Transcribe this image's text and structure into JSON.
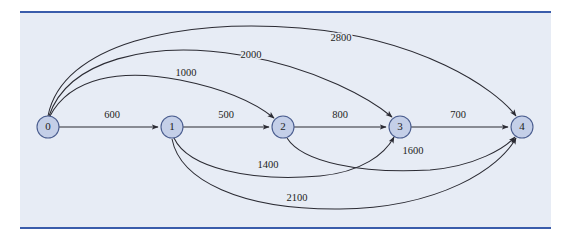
{
  "figure": {
    "type": "directed-weighted-graph",
    "title": "",
    "panel": {
      "x": 20,
      "y": 11,
      "width": 531,
      "height": 218,
      "background_color": "#e7ecf5",
      "rule_color": "#3a5cab"
    },
    "node_style": {
      "fill_color": "#c4cfe8",
      "stroke_color": "#4a5d8f",
      "radius": 11
    },
    "edge_style": {
      "stroke_color": "#2b2b33"
    }
  },
  "nodes": [
    {
      "id": "n0",
      "label": "0",
      "x": 48,
      "y": 127
    },
    {
      "id": "n1",
      "label": "1",
      "x": 172,
      "y": 127
    },
    {
      "id": "n2",
      "label": "2",
      "x": 283,
      "y": 127
    },
    {
      "id": "n3",
      "label": "3",
      "x": 400,
      "y": 127
    },
    {
      "id": "n4",
      "label": "4",
      "x": 522,
      "y": 127
    }
  ],
  "edges": [
    {
      "id": "e-0-1",
      "from": "0",
      "to": "1",
      "weight": "600",
      "label_x": 112,
      "label_y": 116,
      "path": "M 59 127 L 158 127",
      "shape": "straight"
    },
    {
      "id": "e-1-2",
      "from": "1",
      "to": "2",
      "weight": "500",
      "label_x": 226,
      "label_y": 116,
      "path": "M 183 127 L 269 127",
      "shape": "straight"
    },
    {
      "id": "e-2-3",
      "from": "2",
      "to": "3",
      "weight": "800",
      "label_x": 340,
      "label_y": 116,
      "path": "M 294 127 L 386 127",
      "shape": "straight"
    },
    {
      "id": "e-3-4",
      "from": "3",
      "to": "4",
      "weight": "700",
      "label_x": 458,
      "label_y": 116,
      "path": "M 411 127 L 508 127",
      "shape": "straight"
    },
    {
      "id": "e-0-2",
      "from": "0",
      "to": "2",
      "weight": "1000",
      "label_x": 186,
      "label_y": 74,
      "path": "M 50 116 C 70 78, 120 68, 180 80 C 230 90, 258 105, 274 118",
      "shape": "arc-above"
    },
    {
      "id": "e-0-3",
      "from": "0",
      "to": "3",
      "weight": "2000",
      "label_x": 251,
      "label_y": 56,
      "path": "M 49 116 C 68 60, 150 40, 240 55 C 318 68, 372 100, 392 117",
      "shape": "arc-above"
    },
    {
      "id": "e-0-4",
      "from": "0",
      "to": "4",
      "weight": "2800",
      "label_x": 341,
      "label_y": 39,
      "path": "M 48 116 C 62 44, 180 18, 300 28 C 420 38, 495 88, 516 116",
      "shape": "arc-above"
    },
    {
      "id": "e-1-3",
      "from": "1",
      "to": "3",
      "weight": "1400",
      "label_x": 268,
      "label_y": 166,
      "path": "M 174 138 C 188 168, 250 182, 320 176 C 362 172, 385 154, 394 137",
      "shape": "arc-below"
    },
    {
      "id": "e-2-4",
      "from": "2",
      "to": "4",
      "weight": "1600",
      "label_x": 413,
      "label_y": 152,
      "path": "M 287 138 C 302 162, 360 174, 430 170 C 476 166, 505 148, 515 137",
      "shape": "arc-below"
    },
    {
      "id": "e-1-4",
      "from": "1",
      "to": "4",
      "weight": "2100",
      "label_x": 297,
      "label_y": 199,
      "path": "M 172 139 C 180 180, 240 210, 340 209 C 440 208, 500 168, 516 138",
      "shape": "arc-below"
    }
  ]
}
